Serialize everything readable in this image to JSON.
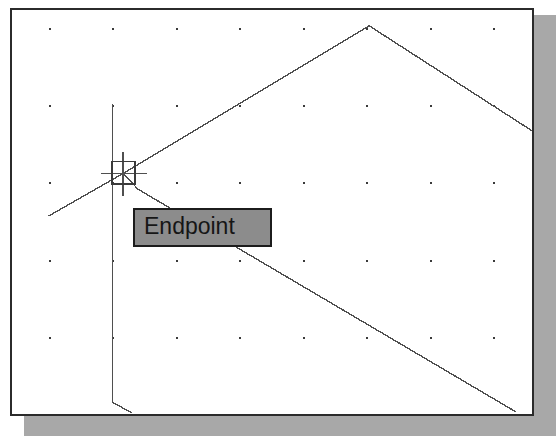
{
  "app": {
    "name": "CAD Drawing Editor",
    "view": "drawing-area"
  },
  "canvas": {
    "width": 524,
    "height": 408,
    "background_color": "#ffffff",
    "border_color": "#2b2b2b",
    "shadow_color": "#a8a8a8"
  },
  "grid": {
    "visible": true,
    "dot_color": "#3a3a3a",
    "spacing_x": 64,
    "spacing_y": 78,
    "origin_x": 37,
    "origin_y": 18,
    "columns": 8,
    "rows": 6
  },
  "snap": {
    "mode": "Endpoint",
    "tooltip_label": "Endpoint",
    "tooltip_background": "#8c8c8c",
    "tooltip_border": "#1c1c1c",
    "tooltip_text_color": "#161616",
    "marker_shape": "square",
    "marker_x": 101,
    "marker_y": 153,
    "marker_size": 23,
    "marker_color": "#3a3a3a"
  },
  "cursor": {
    "type": "crosshair",
    "x": 112,
    "y": 165,
    "color": "#4a4a4a"
  },
  "geometry": {
    "line_color": "#4f4f4f",
    "line_width": 1.4,
    "entities": [
      {
        "name": "roof-left-slope",
        "type": "line",
        "points": [
          [
            112,
            165
          ],
          [
            360,
            16
          ]
        ]
      },
      {
        "name": "roof-right-slope",
        "type": "line",
        "points": [
          [
            360,
            16
          ],
          [
            524,
            122
          ]
        ]
      },
      {
        "name": "lower-left-leader",
        "type": "line",
        "points": [
          [
            112,
            165
          ],
          [
            127,
            181
          ]
        ]
      },
      {
        "name": "lower-diagonal",
        "type": "line",
        "points": [
          [
            127,
            181
          ],
          [
            508,
            406
          ]
        ]
      },
      {
        "name": "left-ray",
        "type": "line",
        "points": [
          [
            112,
            165
          ],
          [
            37,
            208
          ]
        ]
      },
      {
        "name": "vertical-construction-line",
        "type": "line",
        "points": [
          [
            101,
            95
          ],
          [
            101,
            396
          ]
        ]
      },
      {
        "name": "bottom-left-chamfer",
        "type": "line",
        "points": [
          [
            101,
            396
          ],
          [
            121,
            407
          ]
        ]
      },
      {
        "name": "crosshair-horizontal",
        "type": "line",
        "points": [
          [
            90,
            165
          ],
          [
            136,
            165
          ]
        ]
      },
      {
        "name": "crosshair-vertical",
        "type": "line",
        "points": [
          [
            112,
            143
          ],
          [
            112,
            188
          ]
        ]
      }
    ]
  }
}
